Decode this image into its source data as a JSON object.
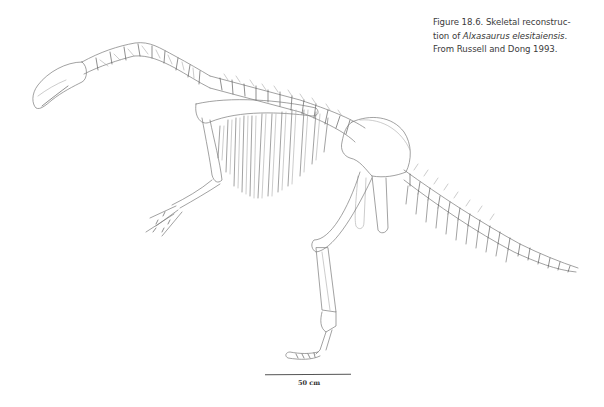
{
  "figure": {
    "caption": {
      "label": "Figure 18.6.",
      "line1": "Figure 18.6. Skeletal reconstruc-",
      "line2_prefix": "tion of ",
      "line2_italic": "Alxasaurus elesitaiensis",
      "line2_suffix": ".",
      "line3": "From Russell and Dong 1993."
    },
    "illustration": {
      "subject": "Skeletal reconstruction of Alxasaurus elesitaiensis",
      "view": "left lateral",
      "parts": [
        "skull",
        "cervical-vertebrae",
        "dorsal-vertebrae",
        "ribs",
        "scapula",
        "forelimb",
        "manus",
        "pelvis",
        "hindlimb",
        "pes",
        "caudal-vertebrae"
      ]
    },
    "scale_bar": {
      "label": "50 cm"
    }
  }
}
